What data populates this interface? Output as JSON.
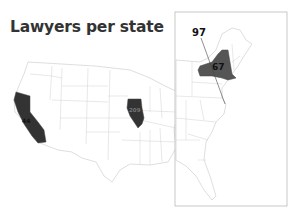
{
  "title": "Lawyers per state",
  "colors": {
    "background": "#ffffff",
    "state_fill": "#ffffff",
    "state_border": "#c8c8c8",
    "highlight_dark": "#333333",
    "highlight_mid": "#555555",
    "inset_border": "#bbbbbb",
    "label_text": "#111111"
  },
  "map": {
    "main": {
      "region": "Contiguous United States",
      "highlighted_states": [
        {
          "state": "California",
          "value": "44"
        },
        {
          "state": "Illinois",
          "value": "209"
        }
      ]
    },
    "inset": {
      "region": "Eastern United States",
      "highlighted_states": [
        {
          "state": "New York",
          "value": "67"
        }
      ],
      "callouts": [
        {
          "label": "97",
          "target": "District of Columbia"
        }
      ]
    }
  }
}
